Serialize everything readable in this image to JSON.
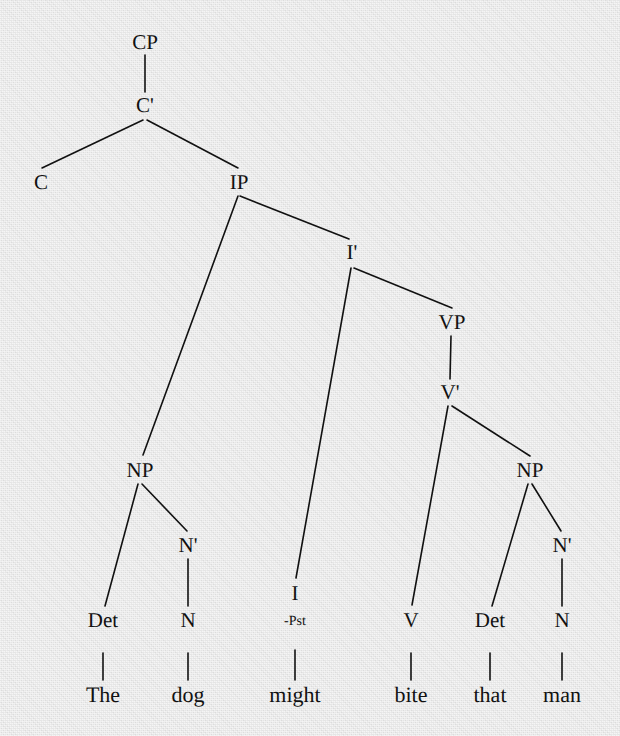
{
  "figure": {
    "kind": "syntax-tree",
    "theory": "x-bar",
    "sentence": "The dog might bite that man",
    "background_color": "#e3e3e3",
    "ink_color": "#111111"
  },
  "nodes": [
    {
      "id": "CP",
      "label": "CP",
      "x": 145,
      "y": 42,
      "size": "cat"
    },
    {
      "id": "Cbar",
      "label": "C'",
      "x": 145,
      "y": 105,
      "size": "cat"
    },
    {
      "id": "C",
      "label": "C",
      "x": 41,
      "y": 182,
      "size": "cat"
    },
    {
      "id": "IP",
      "label": "IP",
      "x": 239,
      "y": 182,
      "size": "cat"
    },
    {
      "id": "Ibar",
      "label": "I'",
      "x": 352,
      "y": 252,
      "size": "cat"
    },
    {
      "id": "VP",
      "label": "VP",
      "x": 452,
      "y": 322,
      "size": "cat"
    },
    {
      "id": "Vbar",
      "label": "V'",
      "x": 450,
      "y": 392,
      "size": "cat"
    },
    {
      "id": "NP1",
      "label": "NP",
      "x": 140,
      "y": 470,
      "size": "cat"
    },
    {
      "id": "NP2",
      "label": "NP",
      "x": 530,
      "y": 470,
      "size": "cat"
    },
    {
      "id": "Nbar1",
      "label": "N'",
      "x": 188,
      "y": 545,
      "size": "cat"
    },
    {
      "id": "Nbar2",
      "label": "N'",
      "x": 562,
      "y": 545,
      "size": "cat"
    },
    {
      "id": "Det1",
      "label": "Det",
      "x": 103,
      "y": 620,
      "size": "cat"
    },
    {
      "id": "N1",
      "label": "N",
      "x": 188,
      "y": 620,
      "size": "cat"
    },
    {
      "id": "I",
      "label": "I",
      "x": 295,
      "y": 593,
      "size": "cat"
    },
    {
      "id": "Ifeat",
      "label": "-Pst",
      "x": 295,
      "y": 622,
      "size": "feat"
    },
    {
      "id": "V",
      "label": "V",
      "x": 411,
      "y": 620,
      "size": "cat"
    },
    {
      "id": "Det2",
      "label": "Det",
      "x": 490,
      "y": 620,
      "size": "cat"
    },
    {
      "id": "N2",
      "label": "N",
      "x": 562,
      "y": 620,
      "size": "cat"
    },
    {
      "id": "w1",
      "label": "The",
      "x": 103,
      "y": 695,
      "size": "word"
    },
    {
      "id": "w2",
      "label": "dog",
      "x": 188,
      "y": 695,
      "size": "word"
    },
    {
      "id": "w3",
      "label": "might",
      "x": 295,
      "y": 695,
      "size": "word"
    },
    {
      "id": "w4",
      "label": "bite",
      "x": 411,
      "y": 695,
      "size": "word"
    },
    {
      "id": "w5",
      "label": "that",
      "x": 490,
      "y": 695,
      "size": "word"
    },
    {
      "id": "w6",
      "label": "man",
      "x": 562,
      "y": 695,
      "size": "word"
    }
  ],
  "edges": [
    {
      "from": "CP",
      "to": "Cbar",
      "x1": 145,
      "y1": 55,
      "x2": 145,
      "y2": 92
    },
    {
      "from": "Cbar",
      "to": "C",
      "x1": 143,
      "y1": 120,
      "x2": 42,
      "y2": 168
    },
    {
      "from": "Cbar",
      "to": "IP",
      "x1": 147,
      "y1": 120,
      "x2": 238,
      "y2": 168
    },
    {
      "from": "IP",
      "to": "NP1",
      "x1": 238,
      "y1": 196,
      "x2": 143,
      "y2": 455
    },
    {
      "from": "IP",
      "to": "Ibar",
      "x1": 240,
      "y1": 196,
      "x2": 349,
      "y2": 239
    },
    {
      "from": "Ibar",
      "to": "I",
      "x1": 351,
      "y1": 268,
      "x2": 296,
      "y2": 578
    },
    {
      "from": "Ibar",
      "to": "VP",
      "x1": 354,
      "y1": 268,
      "x2": 452,
      "y2": 308
    },
    {
      "from": "VP",
      "to": "Vbar",
      "x1": 451,
      "y1": 336,
      "x2": 450,
      "y2": 379
    },
    {
      "from": "Vbar",
      "to": "V",
      "x1": 448,
      "y1": 406,
      "x2": 412,
      "y2": 605
    },
    {
      "from": "Vbar",
      "to": "NP2",
      "x1": 452,
      "y1": 406,
      "x2": 530,
      "y2": 456
    },
    {
      "from": "NP1",
      "to": "Det1",
      "x1": 138,
      "y1": 484,
      "x2": 105,
      "y2": 606
    },
    {
      "from": "NP1",
      "to": "Nbar1",
      "x1": 142,
      "y1": 484,
      "x2": 187,
      "y2": 531
    },
    {
      "from": "Nbar1",
      "to": "N1",
      "x1": 188,
      "y1": 559,
      "x2": 188,
      "y2": 606
    },
    {
      "from": "NP2",
      "to": "Det2",
      "x1": 528,
      "y1": 484,
      "x2": 492,
      "y2": 606
    },
    {
      "from": "NP2",
      "to": "Nbar2",
      "x1": 532,
      "y1": 484,
      "x2": 561,
      "y2": 531
    },
    {
      "from": "Nbar2",
      "to": "N2",
      "x1": 562,
      "y1": 559,
      "x2": 562,
      "y2": 606
    },
    {
      "from": "Det1",
      "to": "w1",
      "x1": 103,
      "y1": 653,
      "x2": 103,
      "y2": 680
    },
    {
      "from": "N1",
      "to": "w2",
      "x1": 188,
      "y1": 653,
      "x2": 188,
      "y2": 680
    },
    {
      "from": "Ifeat",
      "to": "w3",
      "x1": 295,
      "y1": 650,
      "x2": 295,
      "y2": 680
    },
    {
      "from": "V",
      "to": "w4",
      "x1": 411,
      "y1": 653,
      "x2": 411,
      "y2": 680
    },
    {
      "from": "Det2",
      "to": "w5",
      "x1": 490,
      "y1": 653,
      "x2": 490,
      "y2": 680
    },
    {
      "from": "N2",
      "to": "w6",
      "x1": 562,
      "y1": 653,
      "x2": 562,
      "y2": 680
    }
  ]
}
